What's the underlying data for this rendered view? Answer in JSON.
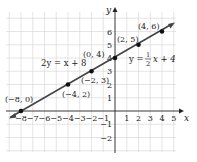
{
  "axes": {
    "x_label": "x",
    "y_label": "y"
  },
  "x_ticks": [
    "−8",
    "−7",
    "−6",
    "−5",
    "−4",
    "−3",
    "−2",
    "−1",
    "1",
    "2",
    "3",
    "4",
    "5"
  ],
  "y_ticks": [
    "6",
    "5",
    "4",
    "3",
    "2",
    "1",
    "−1",
    "−2"
  ],
  "equations": {
    "left": "2y = x + 8",
    "right_prefix": "y = ",
    "right_num": "1",
    "right_den": "2",
    "right_suffix": "x + 4"
  },
  "points": [
    {
      "label": "(−8, 0)"
    },
    {
      "label": "(−4, 2)"
    },
    {
      "label": "(−2, 3)"
    },
    {
      "label": "(0, 4)"
    },
    {
      "label": "(2, 5)"
    },
    {
      "label": "(4, 6)"
    }
  ],
  "colors": {
    "line": "#444444",
    "grid": "#cfcfcf",
    "axis": "#222222"
  }
}
